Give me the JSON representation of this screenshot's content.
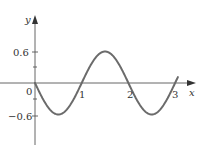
{
  "chart_data": {
    "type": "line",
    "title": "",
    "xlabel": "x",
    "ylabel": "y",
    "function": "y = -0.6 sin(pi x)",
    "series": [
      {
        "name": "curve",
        "x": [
          0,
          0.25,
          0.5,
          0.75,
          1,
          1.25,
          1.5,
          1.75,
          2,
          2.25,
          2.5,
          2.75,
          3
        ],
        "values": [
          0,
          -0.42,
          -0.6,
          -0.42,
          0,
          0.42,
          0.6,
          0.42,
          0,
          -0.42,
          -0.6,
          -0.42,
          0
        ]
      }
    ],
    "x_ticks": [
      "0",
      "1",
      "2",
      "3"
    ],
    "y_ticks": [
      "0.6",
      "-0.6"
    ],
    "y_minor_ticks": [
      0.3,
      -0.3
    ],
    "xlim": [
      0,
      3.3
    ],
    "ylim": [
      -1.0,
      1.0
    ],
    "grid": false,
    "legend": null,
    "color": "#6b6b6b"
  },
  "labels": {
    "x_axis": "x",
    "y_axis": "y",
    "origin": "0",
    "x1": "1",
    "x2": "2",
    "x3": "3",
    "y_pos": "0.6",
    "y_neg": "−0.6"
  }
}
